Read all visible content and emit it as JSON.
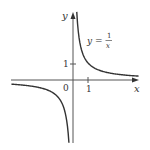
{
  "chart_data": {
    "type": "line",
    "title": "",
    "function": "y = 1/x",
    "xlabel": "x",
    "ylabel": "y",
    "annotations": [
      {
        "text": "y = 1/x",
        "position": "upper right near curve"
      }
    ],
    "origin_label": "0",
    "x_ticks": [
      {
        "value": 1,
        "label": "1"
      }
    ],
    "y_ticks": [
      {
        "value": 1,
        "label": "1"
      }
    ],
    "xlim": [
      -3.8,
      4.0
    ],
    "ylim": [
      -3.8,
      4.0
    ],
    "grid": false,
    "legend": null,
    "series": [
      {
        "name": "y = 1/x (x > 0)",
        "x": [
          0.25,
          0.3,
          0.4,
          0.5,
          0.75,
          1,
          1.5,
          2,
          2.5,
          3,
          3.5,
          3.8
        ],
        "y": [
          4.0,
          3.33,
          2.5,
          2.0,
          1.33,
          1.0,
          0.67,
          0.5,
          0.4,
          0.33,
          0.29,
          0.26
        ]
      },
      {
        "name": "y = 1/x (x < 0)",
        "x": [
          -3.8,
          -3.5,
          -3,
          -2.5,
          -2,
          -1.5,
          -1,
          -0.75,
          -0.5,
          -0.4,
          -0.3,
          -0.25
        ],
        "y": [
          -0.26,
          -0.29,
          -0.33,
          -0.4,
          -0.5,
          -0.67,
          -1.0,
          -1.33,
          -2.0,
          -2.5,
          -3.33,
          -4.0
        ]
      }
    ],
    "colors": {
      "curve": "#333333",
      "axes": "#555555",
      "text": "#333333"
    }
  },
  "labels": {
    "x_axis": "x",
    "y_axis": "y",
    "origin": "0",
    "x_tick_1": "1",
    "y_tick_1": "1",
    "eq_lhs": "y =",
    "eq_num": "1",
    "eq_den": "x"
  }
}
